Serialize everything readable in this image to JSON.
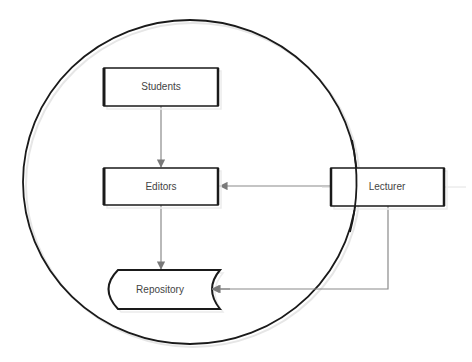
{
  "diagram": {
    "type": "flow",
    "boundary": {
      "shape": "ellipse",
      "cx": 190,
      "cy": 182,
      "rx": 167,
      "ry": 162
    },
    "nodes": [
      {
        "id": "students",
        "label": "Students",
        "shape": "rectangle",
        "x": 104,
        "y": 68,
        "w": 114,
        "h": 38
      },
      {
        "id": "editors",
        "label": "Editors",
        "shape": "rectangle",
        "x": 104,
        "y": 168,
        "w": 114,
        "h": 37
      },
      {
        "id": "lecturer",
        "label": "Lecturer",
        "shape": "rectangle",
        "x": 331,
        "y": 168,
        "w": 113,
        "h": 38
      },
      {
        "id": "repository",
        "label": "Repository",
        "shape": "stored-data",
        "x": 106,
        "y": 270,
        "w": 114,
        "h": 39
      }
    ],
    "edges": [
      {
        "from": "students",
        "to": "editors"
      },
      {
        "from": "editors",
        "to": "repository"
      },
      {
        "from": "lecturer",
        "to": "editors"
      },
      {
        "from": "lecturer",
        "to": "repository"
      }
    ],
    "colors": {
      "outline": "#1a1a1a",
      "connector": "#8a8a8a",
      "text": "#444444"
    }
  }
}
